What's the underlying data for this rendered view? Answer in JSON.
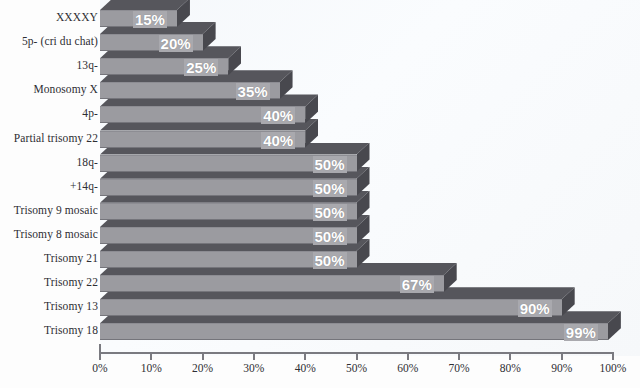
{
  "chart_data": {
    "type": "bar",
    "orientation": "horizontal",
    "title": "",
    "subtitle": "",
    "xlabel": "",
    "ylabel": "",
    "xlim": [
      0,
      100
    ],
    "grid": false,
    "legend": null,
    "value_suffix": "%",
    "xticks": [
      {
        "value": 0,
        "label": "0%"
      },
      {
        "value": 10,
        "label": "10%"
      },
      {
        "value": 20,
        "label": "20%"
      },
      {
        "value": 30,
        "label": "30%"
      },
      {
        "value": 40,
        "label": "40%"
      },
      {
        "value": 50,
        "label": "50%"
      },
      {
        "value": 60,
        "label": "60%"
      },
      {
        "value": 70,
        "label": "70%"
      },
      {
        "value": 80,
        "label": "80%"
      },
      {
        "value": 90,
        "label": "90%"
      },
      {
        "value": 100,
        "label": "100%"
      }
    ],
    "categories": [
      "XXXXY",
      "5p- (cri du chat)",
      "13q-",
      "Monosomy X",
      "4p-",
      "Partial trisomy 22",
      "18q-",
      "+14q-",
      "Trisomy 9 mosaic",
      "Trisomy 8 mosaic",
      "Trisomy 21",
      "Trisomy 22",
      "Trisomy 13",
      "Trisomy 18"
    ],
    "values": [
      15,
      20,
      25,
      35,
      40,
      40,
      50,
      50,
      50,
      50,
      50,
      67,
      90,
      99
    ],
    "data_labels": [
      "15%",
      "20%",
      "25%",
      "35%",
      "40%",
      "40%",
      "50%",
      "50%",
      "50%",
      "50%",
      "50%",
      "67%",
      "90%",
      "99%"
    ],
    "style": {
      "bar_front_color": "#9b9ba0",
      "bar_top_color": "#56565c",
      "bar_side_color": "#48484e",
      "value_label_color": "#ffffff",
      "value_label_bg": "#a9a9ae",
      "plot_background": "#f7f9fb",
      "axis_color": "#7a7a80",
      "text_color": "#2e2e33"
    }
  }
}
